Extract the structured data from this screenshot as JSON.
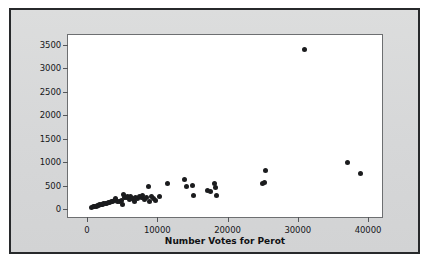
{
  "figure": {
    "background_color": "#d9dadb",
    "border_color": "#27292b",
    "panel_background": "#ffffff",
    "point_color": "#1b1c1e"
  },
  "chart_data": {
    "type": "scatter",
    "title": "",
    "xlabel": "Number Votes for Perot",
    "ylabel": "",
    "xlim": [
      0,
      40000
    ],
    "ylim": [
      0,
      3500
    ],
    "grid": false,
    "legend": null,
    "xticks": [
      0,
      10000,
      20000,
      30000,
      40000
    ],
    "xtick_labels": [
      "0",
      "10000",
      "20000",
      "30000",
      "40000"
    ],
    "yticks": [
      0,
      500,
      1000,
      1500,
      2000,
      2500,
      3000,
      3500
    ],
    "ytick_labels": [
      "0",
      "500",
      "1000",
      "1500",
      "2000",
      "2500",
      "3000",
      "3500"
    ],
    "series": [
      {
        "name": "counties",
        "marker": "filled-circle",
        "color": "#1b1c1e",
        "points": [
          [
            650,
            30
          ],
          [
            900,
            45
          ],
          [
            1100,
            55
          ],
          [
            1350,
            60
          ],
          [
            1500,
            75
          ],
          [
            1700,
            70
          ],
          [
            1850,
            90
          ],
          [
            2050,
            95
          ],
          [
            2250,
            105
          ],
          [
            2400,
            110
          ],
          [
            2600,
            120
          ],
          [
            2800,
            115
          ],
          [
            3000,
            135
          ],
          [
            3250,
            140
          ],
          [
            3500,
            150
          ],
          [
            3700,
            160
          ],
          [
            3900,
            175
          ],
          [
            4100,
            230
          ],
          [
            4300,
            165
          ],
          [
            4600,
            155
          ],
          [
            4850,
            180
          ],
          [
            5050,
            90
          ],
          [
            5200,
            300
          ],
          [
            5400,
            255
          ],
          [
            5600,
            240
          ],
          [
            5800,
            260
          ],
          [
            6000,
            200
          ],
          [
            6250,
            275
          ],
          [
            6500,
            230
          ],
          [
            6700,
            170
          ],
          [
            6950,
            250
          ],
          [
            7200,
            215
          ],
          [
            7450,
            265
          ],
          [
            7700,
            235
          ],
          [
            7950,
            290
          ],
          [
            8200,
            205
          ],
          [
            8450,
            245
          ],
          [
            8700,
            480
          ],
          [
            8900,
            155
          ],
          [
            9200,
            270
          ],
          [
            9500,
            225
          ],
          [
            9800,
            185
          ],
          [
            10300,
            265
          ],
          [
            11400,
            545
          ],
          [
            13900,
            620
          ],
          [
            14200,
            480
          ],
          [
            15000,
            505
          ],
          [
            15200,
            285
          ],
          [
            17200,
            390
          ],
          [
            17600,
            365
          ],
          [
            18100,
            545
          ],
          [
            18300,
            460
          ],
          [
            18400,
            295
          ],
          [
            25000,
            545
          ],
          [
            25300,
            555
          ],
          [
            25400,
            830
          ],
          [
            30900,
            3400
          ],
          [
            37100,
            985
          ],
          [
            38900,
            750
          ]
        ]
      }
    ]
  }
}
